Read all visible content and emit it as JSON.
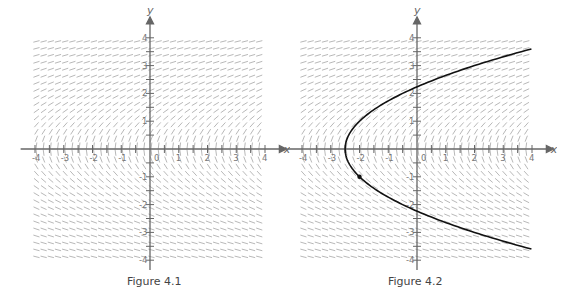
{
  "figures": [
    {
      "caption": "Figure 4.1",
      "x_axis_label": "x",
      "y_axis_label": "y"
    },
    {
      "caption": "Figure 4.2",
      "x_axis_label": "x",
      "y_axis_label": "y"
    }
  ],
  "colors": {
    "axis": "#666666",
    "slope_segment": "#9a9a9a",
    "curve": "#111111",
    "tick_label": "#777777",
    "caption": "#444444"
  },
  "chart_data": [
    {
      "type": "slope_field",
      "title": "Figure 4.1",
      "xlabel": "x",
      "ylabel": "y",
      "xlim": [
        -4,
        4
      ],
      "ylim": [
        -4,
        4
      ],
      "x_ticks": [
        -4,
        -3,
        -2,
        -1,
        0,
        1,
        2,
        3,
        4
      ],
      "y_ticks": [
        -4,
        -3,
        -2,
        -1,
        1,
        2,
        3,
        4
      ],
      "minor_tick_step": 0.5,
      "field_grid_spacing": 0.25,
      "differential_equation": "dy/dx = 1/y",
      "grid": false
    },
    {
      "type": "slope_field",
      "title": "Figure 4.2",
      "xlabel": "x",
      "ylabel": "y",
      "xlim": [
        -4,
        4
      ],
      "ylim": [
        -4,
        4
      ],
      "x_ticks": [
        -4,
        -3,
        -2,
        -1,
        0,
        1,
        2,
        3,
        4
      ],
      "y_ticks": [
        -4,
        -3,
        -2,
        -1,
        1,
        2,
        3,
        4
      ],
      "minor_tick_step": 0.5,
      "field_grid_spacing": 0.25,
      "differential_equation": "dy/dx = 1/y",
      "solution_curve": {
        "equation": "y^2 = 2x + 5",
        "vertex": [
          -2.5,
          0
        ],
        "y_intercepts": [
          2.24,
          -2.24
        ],
        "endpoints": [
          [
            4,
            3.6
          ],
          [
            4,
            -3.6
          ]
        ]
      },
      "marked_point": [
        -2,
        -1
      ],
      "grid": false
    }
  ]
}
